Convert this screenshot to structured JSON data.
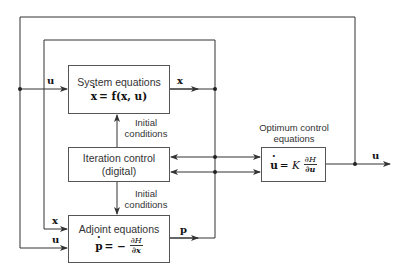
{
  "diagram": {
    "type": "block-diagram",
    "blocks": {
      "system": {
        "title": "System equations",
        "eq_lhs": "x",
        "eq_rhs": "= f(x, u)"
      },
      "iteration": {
        "title": "Iteration control",
        "subtitle": "(digital)"
      },
      "adjoint": {
        "title": "Adjoint equations",
        "eq_lhs": "p",
        "eq_mid": "= −",
        "frac_num": "∂H",
        "frac_den": "∂x"
      },
      "optimum": {
        "title_line1": "Optimum control",
        "title_line2": "equations",
        "eq_lhs": "u",
        "eq_mid": "= K",
        "frac_num": "∂H",
        "frac_den": "∂u"
      }
    },
    "labels": {
      "initial_conditions_top_1": "Initial",
      "initial_conditions_top_2": "conditions",
      "initial_conditions_bottom_1": "Initial",
      "initial_conditions_bottom_2": "conditions"
    },
    "signals": {
      "u_system_in": "u",
      "x_system_out": "x",
      "x_adjoint_in": "x",
      "u_adjoint_in": "u",
      "p_adjoint_out": "p",
      "u_output": "u"
    },
    "colors": {
      "line": "#333333",
      "box_border": "#555555",
      "background": "#ffffff"
    }
  }
}
